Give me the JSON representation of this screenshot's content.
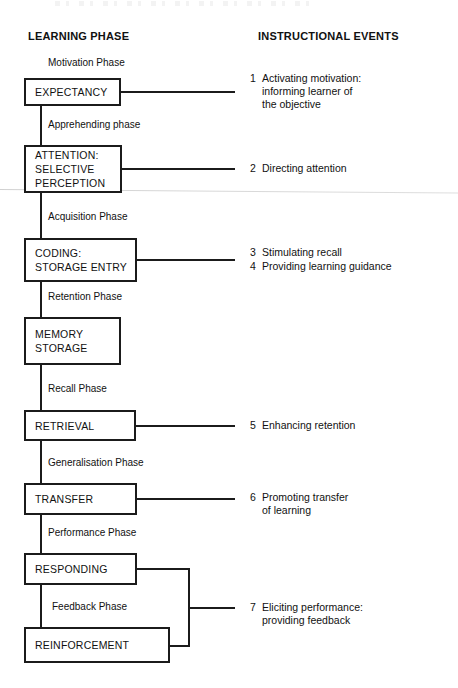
{
  "diagram": {
    "headers": {
      "left": "LEARNING PHASE",
      "right": "INSTRUCTIONAL EVENTS"
    },
    "phases": [
      {
        "label": "Motivation Phase"
      },
      {
        "label": "Apprehending phase"
      },
      {
        "label": "Acquisition Phase"
      },
      {
        "label": "Retention Phase"
      },
      {
        "label": "Recall Phase"
      },
      {
        "label": "Generalisation Phase"
      },
      {
        "label": "Performance Phase"
      },
      {
        "label": "Feedback Phase"
      }
    ],
    "nodes": [
      {
        "label": "EXPECTANCY"
      },
      {
        "label": "ATTENTION:\nSELECTIVE\nPERCEPTION"
      },
      {
        "label": "CODING:\nSTORAGE ENTRY"
      },
      {
        "label": "MEMORY\nSTORAGE"
      },
      {
        "label": "RETRIEVAL"
      },
      {
        "label": "TRANSFER"
      },
      {
        "label": "RESPONDING"
      },
      {
        "label": "REINFORCEMENT"
      }
    ],
    "events": [
      {
        "num": "1",
        "text": "Activating motivation:\ninforming learner of\nthe objective"
      },
      {
        "num": "2",
        "text": "Directing attention"
      },
      {
        "num": "3",
        "text": "Stimulating recall"
      },
      {
        "num": "4",
        "text": "Providing learning guidance"
      },
      {
        "num": "5",
        "text": "Enhancing retention"
      },
      {
        "num": "6",
        "text": "Promoting transfer\nof learning"
      },
      {
        "num": "7",
        "text": "Eliciting performance:\nproviding feedback"
      }
    ],
    "colors": {
      "ink": "#1b1b1b",
      "background": "#ffffff"
    }
  }
}
